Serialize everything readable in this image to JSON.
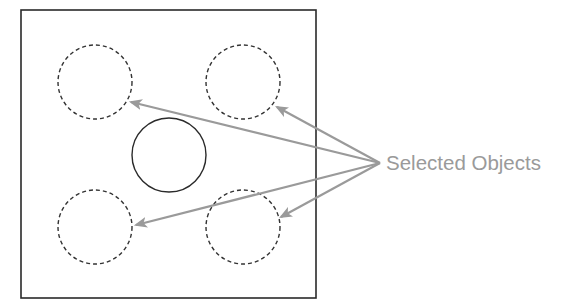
{
  "diagram": {
    "label": "Selected Objects",
    "colors": {
      "frame": "#2a2a2a",
      "circle_solid": "#2a2a2a",
      "circle_dashed": "#333333",
      "arrow": "#9a9a9a",
      "label": "#9a9a9a",
      "background": "#ffffff"
    },
    "frame": {
      "x": 21,
      "y": 10,
      "width": 295,
      "height": 288
    },
    "circles": [
      {
        "id": "top-left",
        "cx": 95,
        "cy": 82,
        "r": 37,
        "selected": true
      },
      {
        "id": "top-right",
        "cx": 243,
        "cy": 82,
        "r": 37,
        "selected": true
      },
      {
        "id": "center",
        "cx": 169,
        "cy": 155,
        "r": 37,
        "selected": false
      },
      {
        "id": "bottom-left",
        "cx": 95,
        "cy": 227,
        "r": 37,
        "selected": true
      },
      {
        "id": "bottom-right",
        "cx": 243,
        "cy": 227,
        "r": 37,
        "selected": true
      }
    ],
    "arrows": [
      {
        "to": "top-left",
        "x1": 380,
        "y1": 163,
        "x2": 131,
        "y2": 102
      },
      {
        "to": "top-right",
        "x1": 380,
        "y1": 163,
        "x2": 277,
        "y2": 107
      },
      {
        "to": "bottom-left",
        "x1": 380,
        "y1": 163,
        "x2": 136,
        "y2": 225
      },
      {
        "to": "bottom-right",
        "x1": 380,
        "y1": 163,
        "x2": 281,
        "y2": 217
      }
    ]
  }
}
